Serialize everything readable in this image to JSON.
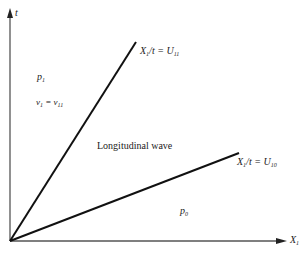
{
  "axes": {
    "y_label": "t",
    "x_label": "X",
    "x_label_sub": "1"
  },
  "lines": [
    {
      "label_var": "X",
      "label_var_sub": "1",
      "label_rest": "/t = U",
      "label_rest_sub": "11"
    },
    {
      "label_var": "X",
      "label_var_sub": "1",
      "label_rest": "/t = U",
      "label_rest_sub": "10"
    }
  ],
  "regions": {
    "upper_pressure": "p",
    "upper_pressure_sub": "1",
    "upper_velocity_lhs": "v",
    "upper_velocity_lhs_sub": "1",
    "upper_velocity_eq": " = v",
    "upper_velocity_rhs_sub": "11",
    "middle": "Longitudinal wave",
    "lower_pressure": "p",
    "lower_pressure_sub": "0"
  }
}
